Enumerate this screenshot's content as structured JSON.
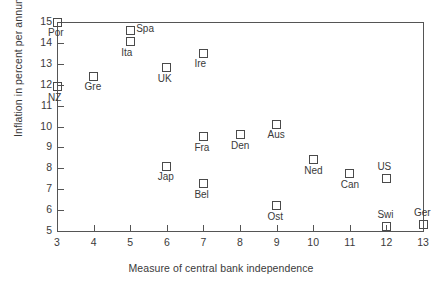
{
  "chart_data": {
    "type": "scatter",
    "title": "",
    "xlabel": "Measure of central bank independence",
    "ylabel": "Inflation in percent per annum",
    "xlim": [
      3,
      13
    ],
    "ylim": [
      5,
      15
    ],
    "grid": false,
    "legend": "none",
    "xticks": [
      "3",
      "4",
      "5",
      "6",
      "7",
      "8",
      "9",
      "10",
      "11",
      "12",
      "13"
    ],
    "yticks": [
      "5",
      "6",
      "7",
      "8",
      "9",
      "10",
      "11",
      "12",
      "13",
      "14",
      "15"
    ],
    "marker_style": "open-square",
    "marker_color": "#4a4a4a",
    "points": [
      {
        "label": "Por",
        "x": 3,
        "y": 15.0,
        "label_pos": "below"
      },
      {
        "label": "NZ",
        "x": 3,
        "y": 11.9,
        "label_pos": "below"
      },
      {
        "label": "Gre",
        "x": 4,
        "y": 12.4,
        "label_pos": "below"
      },
      {
        "label": "Spa",
        "x": 5,
        "y": 14.6,
        "label_pos": "right"
      },
      {
        "label": "Ita",
        "x": 5,
        "y": 14.05,
        "label_pos": "below"
      },
      {
        "label": "UK",
        "x": 6,
        "y": 12.8,
        "label_pos": "below"
      },
      {
        "label": "Jap",
        "x": 6,
        "y": 8.1,
        "label_pos": "below"
      },
      {
        "label": "Ire",
        "x": 7,
        "y": 13.5,
        "label_pos": "below"
      },
      {
        "label": "Fra",
        "x": 7,
        "y": 9.5,
        "label_pos": "below"
      },
      {
        "label": "Bel",
        "x": 7,
        "y": 7.25,
        "label_pos": "below"
      },
      {
        "label": "Den",
        "x": 8,
        "y": 9.6,
        "label_pos": "below"
      },
      {
        "label": "Aus",
        "x": 9,
        "y": 10.1,
        "label_pos": "below"
      },
      {
        "label": "Ost",
        "x": 9,
        "y": 6.2,
        "label_pos": "below"
      },
      {
        "label": "Ned",
        "x": 10,
        "y": 8.4,
        "label_pos": "below"
      },
      {
        "label": "Can",
        "x": 11,
        "y": 7.75,
        "label_pos": "below"
      },
      {
        "label": "US",
        "x": 12,
        "y": 7.5,
        "label_pos": "above"
      },
      {
        "label": "Swi",
        "x": 12,
        "y": 5.2,
        "label_pos": "above"
      },
      {
        "label": "Ger",
        "x": 13,
        "y": 5.3,
        "label_pos": "above"
      }
    ]
  }
}
